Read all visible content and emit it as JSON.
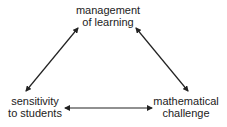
{
  "diagram": {
    "type": "triangle-relationship",
    "nodes": {
      "top": {
        "line1": "management",
        "line2": "of learning"
      },
      "left": {
        "line1": "sensitivity",
        "line2": "to students"
      },
      "right": {
        "line1": "mathematical",
        "line2": "challenge"
      }
    },
    "edges": [
      {
        "from": "left",
        "to": "top",
        "style": "double-headed-arrow"
      },
      {
        "from": "top",
        "to": "right",
        "style": "double-headed-arrow"
      },
      {
        "from": "left",
        "to": "right",
        "style": "double-headed-arrow"
      }
    ],
    "colors": {
      "text": "#222222",
      "arrow": "#222222",
      "background": "#ffffff"
    }
  }
}
